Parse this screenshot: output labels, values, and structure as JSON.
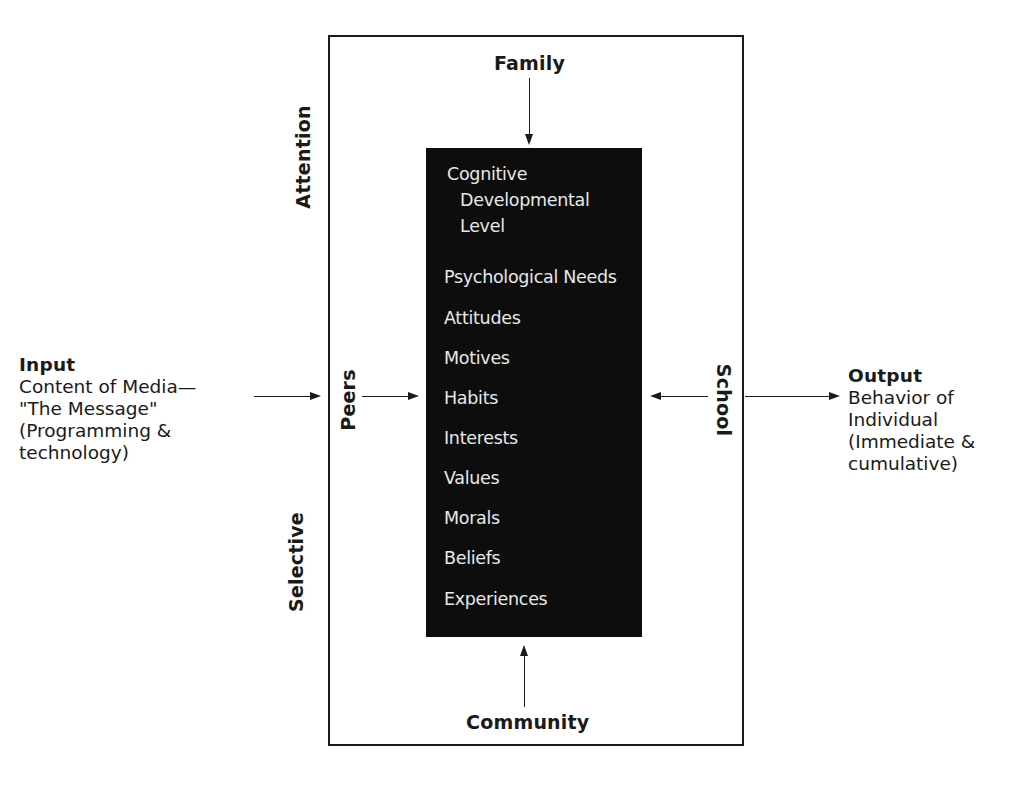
{
  "input": {
    "title": "Input",
    "lines": [
      "Content of Media—",
      "\"The Message\"",
      "(Programming &",
      "technology)"
    ]
  },
  "output": {
    "title": "Output",
    "lines": [
      "Behavior of",
      "Individual",
      "(Immediate &",
      "cumulative)"
    ]
  },
  "filters": {
    "top": "Family",
    "bottom": "Community",
    "left_inner": "Peers",
    "right_inner": "School",
    "left_outer_top": "Attention",
    "left_outer_bottom": "Selective"
  },
  "core": {
    "items": [
      "Cognitive",
      "Developmental",
      "Level",
      "Psychological Needs",
      "Attitudes",
      "Motives",
      "Habits",
      "Interests",
      "Values",
      "Morals",
      "Beliefs",
      "Experiences"
    ]
  },
  "colors": {
    "core_background": "#0d0d0d",
    "core_text": "#e8e8e8",
    "line": "#1a1a1a",
    "background": "#ffffff"
  }
}
